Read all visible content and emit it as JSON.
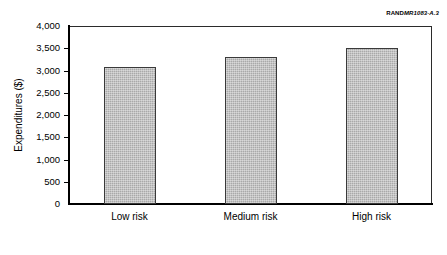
{
  "credit": {
    "brand": "RAND",
    "figure_id": "MR1083-A.3"
  },
  "chart_data": {
    "type": "bar",
    "title": "",
    "xlabel": "",
    "ylabel": "Expenditures ($)",
    "categories": [
      "Low risk",
      "Medium risk",
      "High risk"
    ],
    "values": [
      3080,
      3300,
      3500
    ],
    "ylim": [
      0,
      4000
    ],
    "ytick_values": [
      0,
      500,
      1000,
      1500,
      2000,
      2500,
      3000,
      3500,
      4000
    ],
    "ytick_labels": [
      "0",
      "500",
      "1,000",
      "1,500",
      "2,000",
      "2,500",
      "3,000",
      "3,500",
      "4,000"
    ],
    "grid": false,
    "legend": false,
    "bar_color": "#a9a9a9",
    "bar_edge_color": "#3a3a3a",
    "axis_color": "#000000"
  }
}
